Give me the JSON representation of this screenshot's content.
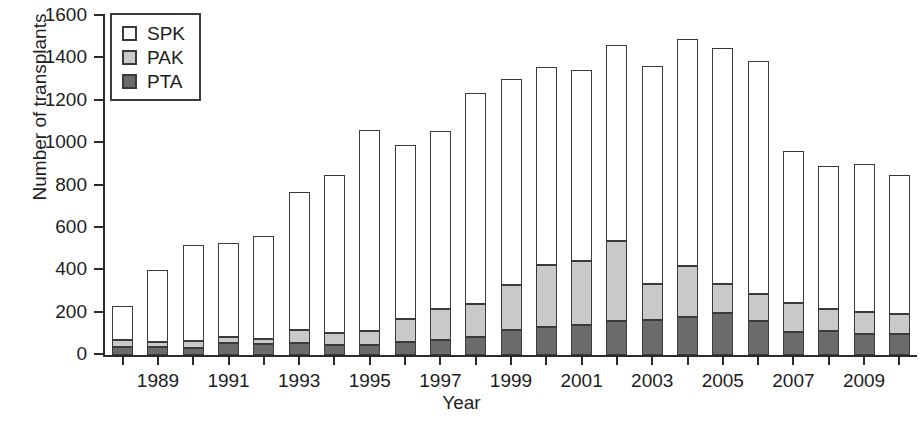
{
  "chart_data": {
    "type": "bar",
    "stacked": true,
    "title": "",
    "xlabel": "Year",
    "ylabel": "Number of transplants",
    "ylim": [
      0,
      1600
    ],
    "ytick_values": [
      0,
      200,
      400,
      600,
      800,
      1000,
      1200,
      1400,
      1600
    ],
    "ytick_labels": [
      "0",
      "200",
      "400",
      "600",
      "800",
      "1000",
      "1200",
      "1400",
      "1600"
    ],
    "grid": false,
    "legend_position": "top-left",
    "categories": [
      1988,
      1989,
      1990,
      1991,
      1992,
      1993,
      1994,
      1995,
      1996,
      1997,
      1998,
      1999,
      2000,
      2001,
      2002,
      2003,
      2004,
      2005,
      2006,
      2007,
      2008,
      2009,
      2010
    ],
    "xtick_labels": [
      "",
      "1989",
      "",
      "1991",
      "",
      "1993",
      "",
      "1995",
      "",
      "1997",
      "",
      "1999",
      "",
      "2001",
      "",
      "2003",
      "",
      "2005",
      "",
      "2007",
      "",
      "2009",
      ""
    ],
    "series": [
      {
        "name": "PTA",
        "color": "#6b6b6b",
        "values": [
          40,
          40,
          35,
          55,
          50,
          55,
          45,
          45,
          60,
          70,
          85,
          120,
          130,
          140,
          160,
          165,
          180,
          200,
          160,
          110,
          115,
          100,
          100
        ]
      },
      {
        "name": "PAK",
        "color": "#c9c9c9",
        "values": [
          30,
          20,
          30,
          30,
          25,
          65,
          60,
          70,
          110,
          145,
          155,
          210,
          295,
          305,
          380,
          170,
          240,
          135,
          130,
          135,
          100,
          105,
          95
        ]
      },
      {
        "name": "SPK",
        "color": "#ffffff",
        "values": [
          160,
          340,
          455,
          445,
          485,
          650,
          745,
          945,
          820,
          840,
          995,
          975,
          935,
          900,
          925,
          1030,
          1070,
          1115,
          1100,
          720,
          675,
          695,
          655
        ]
      }
    ],
    "totals": [
      230,
      400,
      520,
      530,
      560,
      770,
      850,
      1060,
      990,
      1055,
      1235,
      1305,
      1360,
      1345,
      1465,
      1365,
      1490,
      1450,
      1390,
      965,
      890,
      900,
      850
    ]
  },
  "legend": {
    "entries": [
      {
        "label": "SPK",
        "swatch": "spk"
      },
      {
        "label": "PAK",
        "swatch": "pak"
      },
      {
        "label": "PTA",
        "swatch": "pta"
      }
    ]
  }
}
